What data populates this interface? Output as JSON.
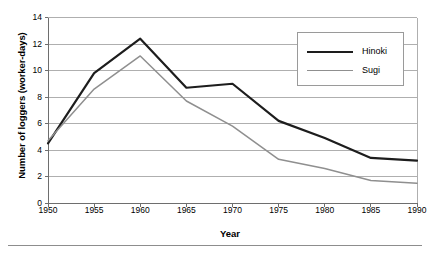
{
  "chart_data": {
    "type": "line",
    "title": "",
    "xlabel": "Year",
    "ylabel": "Number of loggers (worker-days)",
    "x": [
      1950,
      1955,
      1960,
      1965,
      1970,
      1975,
      1980,
      1985,
      1990
    ],
    "categories": [
      "1950",
      "1955",
      "1960",
      "1965",
      "1970",
      "1975",
      "1980",
      "1985",
      "1990"
    ],
    "xlim": [
      1950,
      1990
    ],
    "ylim": [
      0,
      14
    ],
    "yticks": [
      0,
      2,
      4,
      6,
      8,
      10,
      12,
      14
    ],
    "ytick_labels": [
      "0",
      "2",
      "4",
      "6",
      "8",
      "10",
      "12",
      "14"
    ],
    "xtick_labels": [
      "1950",
      "1955",
      "1960",
      "1965",
      "1970",
      "1975",
      "1980",
      "1985",
      "1990"
    ],
    "grid": "horizontal",
    "legend_position": "top-right",
    "series": [
      {
        "name": "Hinoki",
        "color": "#1d1d1d",
        "values": [
          4.5,
          9.8,
          12.4,
          8.7,
          9.0,
          6.2,
          4.9,
          3.4,
          3.2
        ]
      },
      {
        "name": "Sugi",
        "color": "#8f8f8f",
        "values": [
          4.7,
          8.6,
          11.1,
          7.7,
          5.8,
          3.3,
          2.6,
          1.7,
          1.5
        ]
      }
    ]
  },
  "legend": {
    "entries": [
      {
        "label": "Hinoki"
      },
      {
        "label": "Sugi"
      }
    ]
  }
}
